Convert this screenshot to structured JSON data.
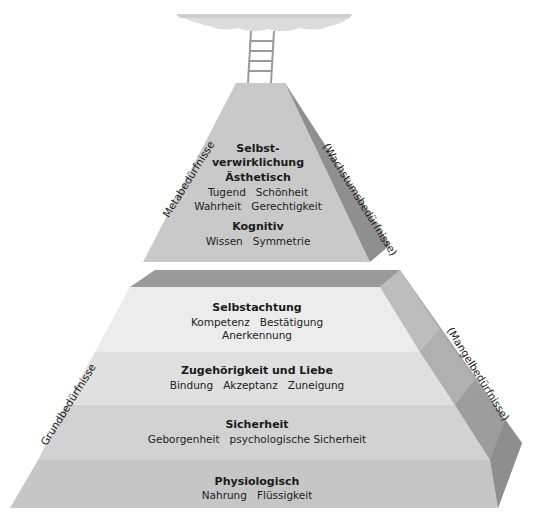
{
  "diagram": {
    "type": "pyramid",
    "colors": {
      "upper_front": "#c9c9c9",
      "upper_side": "#8f8f8f",
      "lower_top_face": "#9a9a9a",
      "band_1": "#ececec",
      "band_2": "#e0e0e0",
      "band_3": "#d2d2d2",
      "band_4": "#c6c6c6",
      "side_light": "#b3b3b3",
      "side_dark": "#8e8e8e",
      "cloud": "#d9d9d9",
      "ladder": "#9a9a9a"
    },
    "upper": {
      "left_label": "Metabedürfnisse",
      "right_label": "(Wachstumsbedürfnisse)",
      "levels": [
        {
          "title_line1": "Selbst-",
          "title_line2": "verwirklichung",
          "items": []
        },
        {
          "title": "Ästhetisch",
          "items_row1": [
            "Tugend",
            "Schönheit"
          ],
          "items_row2": [
            "Wahrheit",
            "Gerechtigkeit"
          ]
        },
        {
          "title": "Kognitiv",
          "items_row1": [
            "Wissen",
            "Symmetrie"
          ]
        }
      ]
    },
    "lower": {
      "left_label": "Grundbedürfnisse",
      "right_label": "(Mangelbedürfnisse)",
      "levels": [
        {
          "title": "Selbstachtung",
          "items_row1": [
            "Kompetenz",
            "Bestätigung"
          ],
          "items_row2": [
            "Anerkennung"
          ]
        },
        {
          "title": "Zugehörigkeit und Liebe",
          "items_row1": [
            "Bindung",
            "Akzeptanz",
            "Zuneigung"
          ]
        },
        {
          "title": "Sicherheit",
          "items_row1": [
            "Geborgenheit",
            "psychologische Sicherheit"
          ]
        },
        {
          "title": "Physiologisch",
          "items_row1": [
            "Nahrung",
            "Flüssigkeit"
          ]
        }
      ]
    }
  }
}
